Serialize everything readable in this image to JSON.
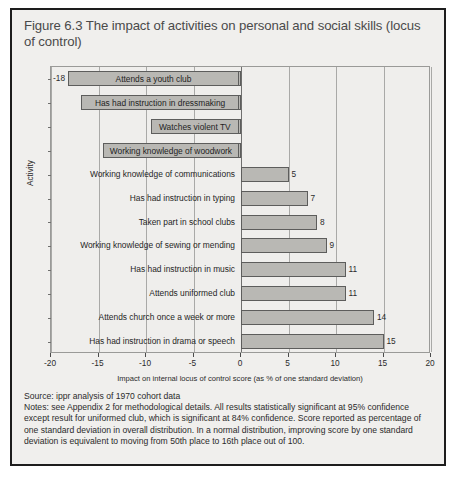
{
  "figure": {
    "title": "Figure 6.3 The impact of activities on personal and social skills (locus of control)",
    "source": "Source: ippr analysis of 1970 cohort data",
    "notes": "Notes: see Appendix 2 for methodological details. All results statistically significant at 95% confidence except result for uniformed club, which is significant at 84% confidence. Score reported as percentage of one standard deviation in overall distribution. In a normal distribution, improving score by one standard deviation is equivalent to moving from 50th place to 16th place out of 100."
  },
  "chart_data": {
    "type": "bar",
    "orientation": "horizontal",
    "title": "Figure 6.3 The impact of activities on personal and social skills (locus of control)",
    "xlabel": "Impact on internal locus of control score (as % of one standard deviation)",
    "ylabel": "Activity",
    "xlim": [
      -20,
      20
    ],
    "xticks": [
      -20,
      -15,
      -10,
      -5,
      0,
      5,
      10,
      15,
      20
    ],
    "xticklabels": [
      "-20",
      "-15",
      "-10",
      "-5",
      "0",
      "5",
      "10",
      "15",
      "20"
    ],
    "grid": true,
    "legend": false,
    "categories": [
      "Attends a youth club",
      "Has had instruction in dressmaking",
      "Watches violent TV",
      "Working knowledge of woodwork",
      "Working knowledge of communications",
      "Has had instruction in typing",
      "Taken part in school clubs",
      "Working knowledge of sewing or mending",
      "Has had instruction in music",
      "Attends uniformed club",
      "Attends church once a week or more",
      "Has had instruction in drama or speech"
    ],
    "values": [
      -18,
      -12,
      -8,
      -5,
      5,
      7,
      8,
      9,
      11,
      11,
      14,
      15
    ],
    "value_labels": [
      "-18",
      "-12",
      "-8",
      "-5",
      "5",
      "7",
      "8",
      "9",
      "11",
      "11",
      "14",
      "15"
    ],
    "bar_color": "#b9b8b4",
    "bar_edge_color": "#5d5d5c"
  }
}
